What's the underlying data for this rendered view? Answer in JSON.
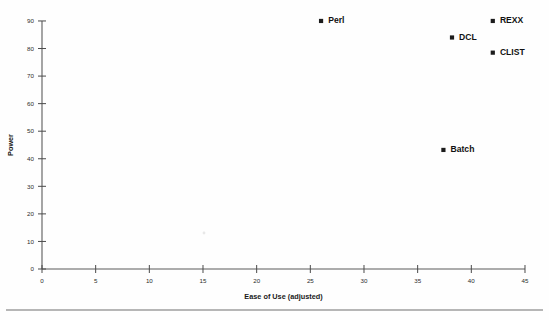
{
  "chart_data": {
    "type": "scatter",
    "title": "",
    "xlabel": "Ease of Use (adjusted)",
    "ylabel": "Power",
    "xlim": [
      0,
      45
    ],
    "ylim": [
      0,
      90
    ],
    "xticks": [
      0,
      5,
      10,
      15,
      20,
      25,
      30,
      35,
      40,
      45
    ],
    "yticks": [
      0,
      10,
      20,
      30,
      40,
      50,
      60,
      70,
      80,
      90
    ],
    "grid": false,
    "legend": "none",
    "marker_color": "#1c1c1c",
    "axis_color": "#5a5a5a",
    "points": [
      {
        "label": "Perl",
        "x": 26.0,
        "y": 90.0,
        "label_dx": 5,
        "label_dy": 0
      },
      {
        "label": "DCL",
        "x": 38.2,
        "y": 84.0,
        "label_dx": 5,
        "label_dy": 0
      },
      {
        "label": "REXX",
        "x": 42.0,
        "y": 90.0,
        "label_dx": 5,
        "label_dy": 0
      },
      {
        "label": "CLIST",
        "x": 42.0,
        "y": 78.5,
        "label_dx": 5,
        "label_dy": 0
      },
      {
        "label": "Batch",
        "x": 37.4,
        "y": 43.2,
        "label_dx": 5,
        "label_dy": 0
      }
    ]
  },
  "geometry": {
    "origin_x": 42,
    "origin_y": 269,
    "x_px_per_unit": 10.733,
    "y_px_per_unit": 2.756,
    "footer_rule_y": 310,
    "footer_rule_x1": 6,
    "footer_rule_x2": 543
  },
  "page": {
    "background": "#fefefe",
    "width": 549,
    "height": 320
  }
}
